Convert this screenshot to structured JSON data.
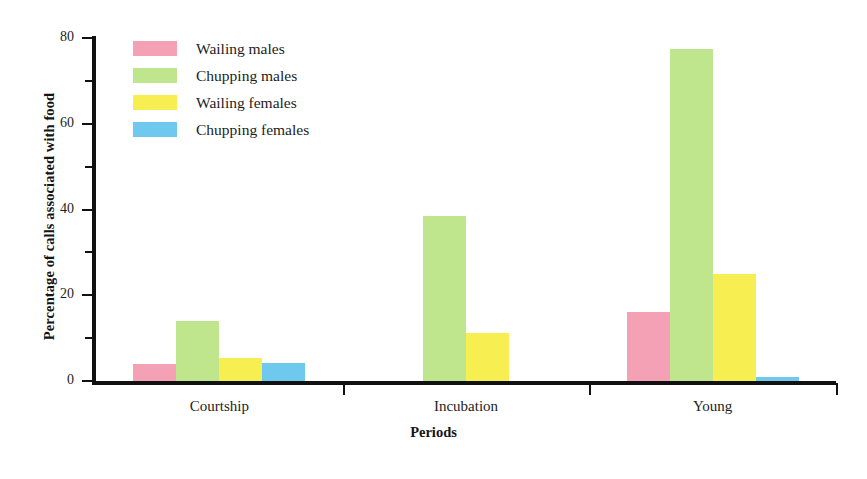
{
  "chart_data": {
    "type": "bar",
    "title": "",
    "xlabel": "Periods",
    "ylabel": "Percentage of calls associated with food",
    "ylim": [
      0,
      80
    ],
    "grid": false,
    "legend_position": "upper-left-inside",
    "categories": [
      "Courtship",
      "Incubation",
      "Young"
    ],
    "y_ticks_major": [
      "0",
      "20",
      "40",
      "60",
      "80"
    ],
    "y_ticks_major_values": [
      0,
      20,
      40,
      60,
      80
    ],
    "y_ticks_minor_values": [
      10,
      30,
      50,
      70
    ],
    "series": [
      {
        "name": "Wailing males",
        "color": "#F4A0B5",
        "values": [
          4.0,
          0.0,
          16.0
        ]
      },
      {
        "name": "Chupping males",
        "color": "#BFE68C",
        "values": [
          14.0,
          38.5,
          77.5
        ]
      },
      {
        "name": "Wailing females",
        "color": "#F7EE52",
        "values": [
          5.3,
          11.3,
          25.0
        ]
      },
      {
        "name": "Chupping females",
        "color": "#6FC8EE",
        "values": [
          4.2,
          0.0,
          1.0
        ]
      }
    ]
  },
  "legend": {
    "items": [
      {
        "label": "Wailing males"
      },
      {
        "label": "Chupping males"
      },
      {
        "label": "Wailing females"
      },
      {
        "label": "Chupping females"
      }
    ]
  },
  "axes": {
    "y_title": "Percentage of calls associated with food",
    "x_title": "Periods"
  },
  "caption": {
    "text": ""
  }
}
